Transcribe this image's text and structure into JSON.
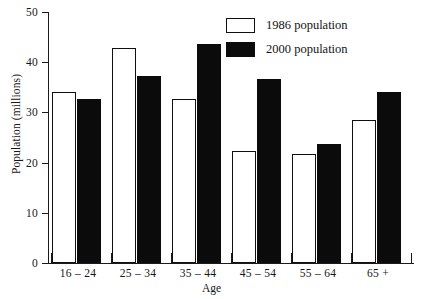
{
  "chart_data": {
    "type": "bar",
    "title": "",
    "xlabel": "Age",
    "ylabel": "Population (millions)",
    "categories": [
      "16 – 24",
      "25 – 34",
      "35 – 44",
      "45 – 54",
      "55 – 64",
      "65 +"
    ],
    "series": [
      {
        "name": "1986 population",
        "color": "#ffffff",
        "edge_color": "#101010",
        "values": [
          34.0,
          42.8,
          32.6,
          22.4,
          21.8,
          28.4
        ]
      },
      {
        "name": "2000 population",
        "color": "#0b0b0b",
        "edge_color": "#0b0b0b",
        "values": [
          32.6,
          37.2,
          43.6,
          36.6,
          23.8,
          34.0
        ]
      }
    ],
    "ylim": [
      0,
      50
    ],
    "yticks": [
      0,
      10,
      20,
      30,
      40,
      50
    ],
    "ytick_labels": [
      "0",
      "10",
      "20",
      "30",
      "40",
      "50"
    ],
    "grid": false,
    "legend_position": "top-right"
  },
  "legend": {
    "items": [
      {
        "label": "1986 population",
        "swatch": "white"
      },
      {
        "label": "2000 population",
        "swatch": "black"
      }
    ]
  },
  "axes": {
    "x_title": "Age",
    "y_title": "Population (millions)"
  }
}
